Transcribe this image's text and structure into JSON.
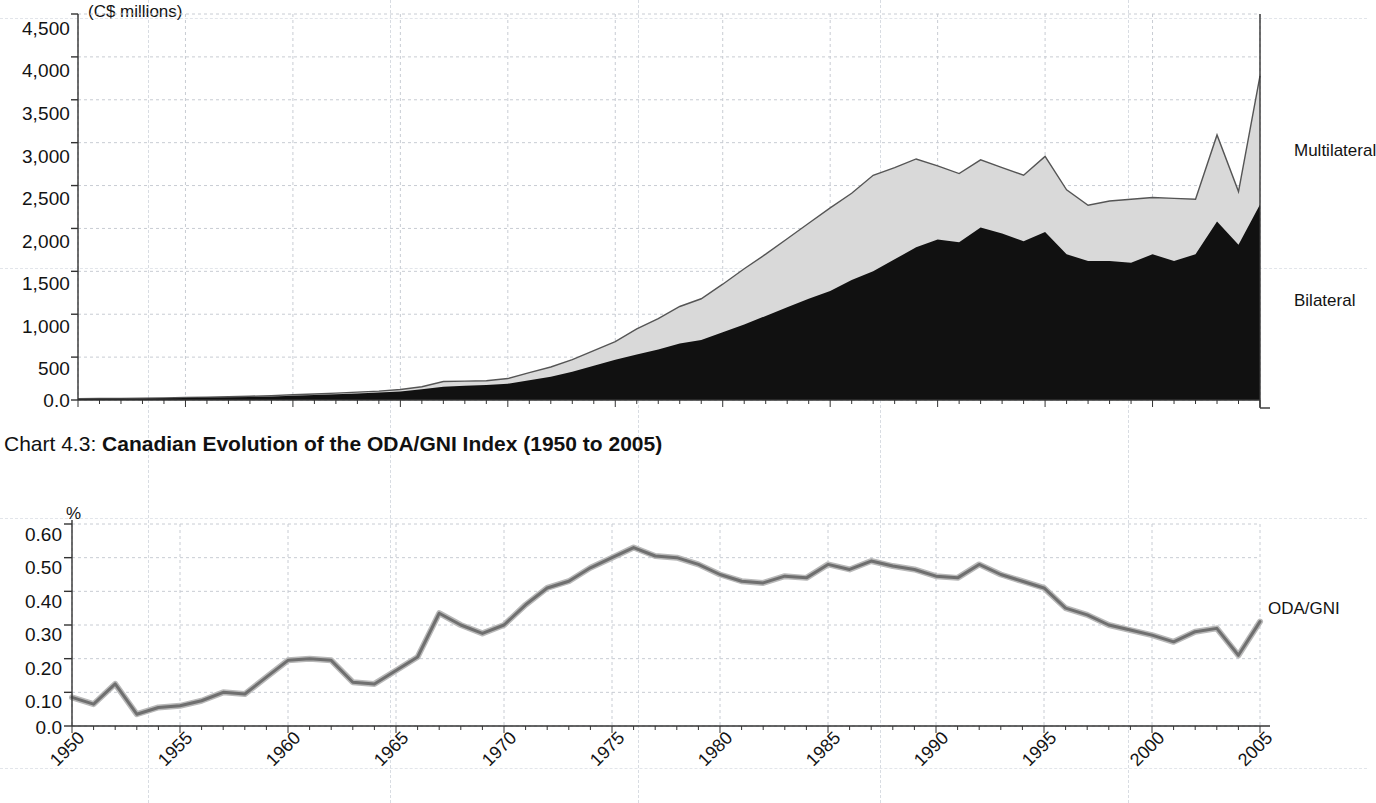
{
  "chart_data": [
    {
      "type": "area",
      "id": "chart-4-2-oda-volumes",
      "title": "",
      "subtitle": "",
      "unit_label": "(C$ millions)",
      "xlabel": "",
      "ylabel": "",
      "ylim": [
        0,
        4500
      ],
      "ytick_labels": [
        "4,500",
        "4,000",
        "3,500",
        "3,000",
        "2,500",
        "2,000",
        "1,500",
        "1,000",
        "500",
        "0.0"
      ],
      "yticks": [
        4500,
        4000,
        3500,
        3000,
        2500,
        2000,
        1500,
        1000,
        500,
        0
      ],
      "grid": true,
      "stacked": true,
      "legend_position": "right",
      "legend": [
        "Multilateral",
        "Bilateral"
      ],
      "x": [
        1950,
        1951,
        1952,
        1953,
        1954,
        1955,
        1956,
        1957,
        1958,
        1959,
        1960,
        1961,
        1962,
        1963,
        1964,
        1965,
        1966,
        1967,
        1968,
        1969,
        1970,
        1971,
        1972,
        1973,
        1974,
        1975,
        1976,
        1977,
        1978,
        1979,
        1980,
        1981,
        1982,
        1983,
        1984,
        1985,
        1986,
        1987,
        1988,
        1989,
        1990,
        1991,
        1992,
        1993,
        1994,
        1995,
        1996,
        1997,
        1998,
        1999,
        2000,
        2001,
        2002,
        2003,
        2004,
        2005
      ],
      "series": [
        {
          "name": "Bilateral",
          "color": "#111111",
          "values": [
            12,
            14,
            16,
            18,
            20,
            24,
            28,
            32,
            36,
            42,
            50,
            58,
            66,
            76,
            86,
            100,
            125,
            155,
            165,
            175,
            190,
            230,
            270,
            330,
            400,
            470,
            530,
            590,
            660,
            700,
            790,
            880,
            980,
            1080,
            1180,
            1270,
            1400,
            1500,
            1640,
            1780,
            1870,
            1840,
            2010,
            1940,
            1850,
            1960,
            1700,
            1620,
            1620,
            1600,
            1700,
            1620,
            1700,
            2080,
            1810,
            2280
          ]
        },
        {
          "name": "Multilateral",
          "color": "#d9d9d9",
          "values": [
            2,
            3,
            3,
            4,
            4,
            5,
            6,
            7,
            8,
            9,
            11,
            12,
            14,
            16,
            18,
            22,
            30,
            60,
            55,
            50,
            60,
            90,
            115,
            140,
            175,
            210,
            300,
            360,
            430,
            480,
            560,
            650,
            720,
            800,
            880,
            970,
            1010,
            1120,
            1070,
            1030,
            860,
            800,
            790,
            770,
            770,
            880,
            750,
            650,
            700,
            740,
            660,
            730,
            640,
            1010,
            620,
            1500
          ]
        }
      ],
      "total_peak_value": 3800,
      "total_peak_year": 2005
    },
    {
      "type": "line",
      "id": "chart-4-3-oda-gni",
      "title_prefix": "Chart 4.3: ",
      "title": "Canadian Evolution of the ODA/GNI Index (1950 to 2005)",
      "unit_label": "%",
      "xlabel": "",
      "ylabel": "",
      "ylim": [
        0,
        0.6
      ],
      "ytick_labels": [
        "0.60",
        "0.50",
        "0.40",
        "0.30",
        "0.20",
        "0.10",
        "0.0"
      ],
      "yticks": [
        0.6,
        0.5,
        0.4,
        0.3,
        0.2,
        0.1,
        0.0
      ],
      "grid": true,
      "legend_position": "right",
      "legend": [
        "ODA/GNI"
      ],
      "line_color": "#808080",
      "xtick_labels": [
        "1950",
        "1955",
        "1960",
        "1965",
        "1970",
        "1975",
        "1980",
        "1985",
        "1990",
        "1995",
        "2000",
        "2005"
      ],
      "xticks": [
        1950,
        1955,
        1960,
        1965,
        1970,
        1975,
        1980,
        1985,
        1990,
        1995,
        2000,
        2005
      ],
      "xlim": [
        1950,
        2005
      ],
      "x": [
        1950,
        1951,
        1952,
        1953,
        1954,
        1955,
        1956,
        1957,
        1958,
        1959,
        1960,
        1961,
        1962,
        1963,
        1964,
        1965,
        1966,
        1967,
        1968,
        1969,
        1970,
        1971,
        1972,
        1973,
        1974,
        1975,
        1976,
        1977,
        1978,
        1979,
        1980,
        1981,
        1982,
        1983,
        1984,
        1985,
        1986,
        1987,
        1988,
        1989,
        1990,
        1991,
        1992,
        1993,
        1994,
        1995,
        1996,
        1997,
        1998,
        1999,
        2000,
        2001,
        2002,
        2003,
        2004,
        2005
      ],
      "series": [
        {
          "name": "ODA/GNI",
          "values": [
            0.085,
            0.065,
            0.125,
            0.035,
            0.055,
            0.06,
            0.075,
            0.1,
            0.095,
            0.145,
            0.195,
            0.2,
            0.195,
            0.13,
            0.125,
            0.165,
            0.205,
            0.335,
            0.3,
            0.275,
            0.3,
            0.36,
            0.41,
            0.43,
            0.47,
            0.5,
            0.53,
            0.505,
            0.5,
            0.48,
            0.45,
            0.43,
            0.425,
            0.445,
            0.44,
            0.48,
            0.465,
            0.49,
            0.475,
            0.465,
            0.445,
            0.44,
            0.48,
            0.45,
            0.43,
            0.41,
            0.35,
            0.33,
            0.3,
            0.285,
            0.27,
            0.25,
            0.28,
            0.29,
            0.21,
            0.31
          ]
        }
      ]
    }
  ],
  "chart1": {
    "unit": "(C$ millions)",
    "legend_multilateral": "Multilateral",
    "legend_bilateral": "Bilateral",
    "yticks": [
      "4,500",
      "4,000",
      "3,500",
      "3,000",
      "2,500",
      "2,000",
      "1,500",
      "1,000",
      "500",
      "0.0"
    ]
  },
  "chart2": {
    "title_prefix": "Chart 4.3: ",
    "title_bold": "Canadian Evolution of the ODA/GNI Index (1950 to 2005)",
    "unit": "%",
    "legend_oda_gni": "ODA/GNI",
    "yticks": [
      "0.60",
      "0.50",
      "0.40",
      "0.30",
      "0.20",
      "0.10",
      "0.0"
    ],
    "xticks": [
      "1950",
      "1955",
      "1960",
      "1965",
      "1970",
      "1975",
      "1980",
      "1985",
      "1990",
      "1995",
      "2000",
      "2005"
    ]
  }
}
